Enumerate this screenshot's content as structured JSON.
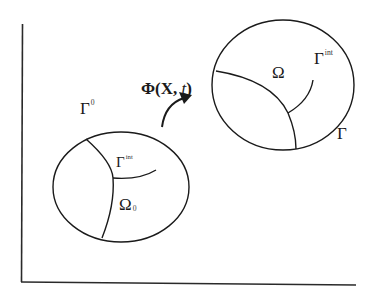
{
  "diagram": {
    "mapping_label": {
      "main": "Φ(X, ",
      "var": "t",
      "close": ")"
    },
    "reference_domain": {
      "boundary_label": {
        "base": "Γ",
        "sup": "0"
      },
      "interface_label": {
        "base": "Γ",
        "sup": "int"
      },
      "domain_label": {
        "base": "Ω",
        "sub": "0"
      }
    },
    "current_domain": {
      "boundary_label": {
        "base": "Γ",
        "sup": ""
      },
      "interface_label": {
        "base": "Γ",
        "sup": "int"
      },
      "domain_label": {
        "base": "Ω"
      }
    },
    "colors": {
      "line": "#1a1a1a",
      "background": "#ffffff"
    }
  }
}
